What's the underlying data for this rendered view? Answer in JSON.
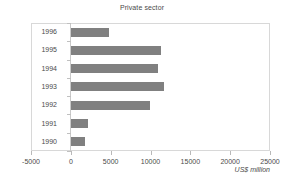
{
  "chart_data": {
    "type": "bar",
    "orientation": "horizontal",
    "title": "Private sector",
    "xlabel": "US$ million",
    "ylabel": "",
    "categories": [
      "1996",
      "1995",
      "1994",
      "1993",
      "1992",
      "1991",
      "1990"
    ],
    "values": [
      4750,
      11300,
      10900,
      11750,
      9900,
      2100,
      1750
    ],
    "xlim": [
      -5000,
      25000
    ],
    "xticks": [
      -5000,
      0,
      5000,
      10000,
      15000,
      20000,
      25000
    ],
    "xtick_labels": [
      "-5000",
      "0",
      "5000",
      "10000",
      "15000",
      "20000",
      "25000"
    ],
    "grid": false,
    "legend": null,
    "bar_color": "#808080",
    "frame_color": "#d8d8d8",
    "text_color": "#4a4a4a"
  }
}
